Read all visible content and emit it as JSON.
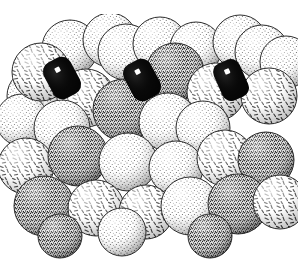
{
  "figure": {
    "kind": "scientific-illustration",
    "style": "black-and-white stippled / hatched line drawing",
    "background_color": "#ffffff",
    "ink_color": "#1a1a1a"
  },
  "caption_fragment": {
    "text": "clipped text line at top edge",
    "visible": "partial descenders only"
  },
  "palette": {
    "outline": "#222222",
    "fill_light": "#ffffff",
    "fill_mid": "#d8d8d8",
    "fill_dark": "#7a7a7a",
    "linker_black": "#0b0b0b",
    "highlight_white": "#ffffff"
  },
  "legend": {
    "sphere_textures": [
      {
        "id": "dash",
        "label": "short-dash hatch (lightest spheres)"
      },
      {
        "id": "fine-stipple",
        "label": "fine stipple (mid-tone spheres)"
      },
      {
        "id": "dense-stipple",
        "label": "dense stipple (dark spheres)"
      }
    ]
  },
  "linkers": [
    {
      "id": "linker-left",
      "cx": 62,
      "cy": 78,
      "w": 30,
      "h": 40,
      "rot": -28,
      "highlight": true
    },
    {
      "id": "linker-center",
      "cx": 142,
      "cy": 80,
      "w": 30,
      "h": 40,
      "rot": -28,
      "highlight": true
    },
    {
      "id": "linker-right",
      "cx": 231,
      "cy": 80,
      "w": 28,
      "h": 40,
      "rot": -24,
      "highlight": true
    }
  ],
  "spheres_back": [
    {
      "cx": 70,
      "cy": 48,
      "r": 28,
      "tex": "fine-stipple"
    },
    {
      "cx": 110,
      "cy": 40,
      "r": 27,
      "tex": "fine-stipple"
    },
    {
      "cx": 126,
      "cy": 52,
      "r": 28,
      "tex": "fine-stipple"
    },
    {
      "cx": 160,
      "cy": 44,
      "r": 27,
      "tex": "fine-stipple"
    },
    {
      "cx": 196,
      "cy": 48,
      "r": 26,
      "tex": "fine-stipple"
    },
    {
      "cx": 240,
      "cy": 42,
      "r": 27,
      "tex": "fine-stipple"
    },
    {
      "cx": 262,
      "cy": 52,
      "r": 27,
      "tex": "fine-stipple"
    },
    {
      "cx": 286,
      "cy": 62,
      "r": 26,
      "tex": "fine-stipple"
    },
    {
      "cx": 34,
      "cy": 96,
      "r": 27,
      "tex": "fine-stipple"
    },
    {
      "cx": 22,
      "cy": 120,
      "r": 26,
      "tex": "fine-stipple"
    }
  ],
  "spheres_mid": [
    {
      "cx": 41,
      "cy": 72,
      "r": 29,
      "tex": "dash"
    },
    {
      "cx": 86,
      "cy": 98,
      "r": 29,
      "tex": "dash"
    },
    {
      "cx": 175,
      "cy": 72,
      "r": 29,
      "tex": "dense-stipple"
    },
    {
      "cx": 124,
      "cy": 110,
      "r": 31,
      "tex": "dense-stipple"
    },
    {
      "cx": 216,
      "cy": 92,
      "r": 29,
      "tex": "dash"
    },
    {
      "cx": 269,
      "cy": 96,
      "r": 28,
      "tex": "dash"
    },
    {
      "cx": 62,
      "cy": 128,
      "r": 28,
      "tex": "fine-stipple"
    },
    {
      "cx": 168,
      "cy": 122,
      "r": 29,
      "tex": "fine-stipple"
    },
    {
      "cx": 203,
      "cy": 128,
      "r": 27,
      "tex": "fine-stipple"
    }
  ],
  "spheres_front": [
    {
      "cx": 26,
      "cy": 166,
      "r": 28,
      "tex": "dash"
    },
    {
      "cx": 78,
      "cy": 156,
      "r": 30,
      "tex": "dense-stipple"
    },
    {
      "cx": 128,
      "cy": 162,
      "r": 29,
      "tex": "fine-stipple"
    },
    {
      "cx": 176,
      "cy": 168,
      "r": 27,
      "tex": "fine-stipple"
    },
    {
      "cx": 225,
      "cy": 158,
      "r": 28,
      "tex": "dash"
    },
    {
      "cx": 266,
      "cy": 160,
      "r": 28,
      "tex": "dense-stipple"
    },
    {
      "cx": 44,
      "cy": 206,
      "r": 30,
      "tex": "dense-stipple"
    },
    {
      "cx": 96,
      "cy": 208,
      "r": 28,
      "tex": "dash"
    },
    {
      "cx": 146,
      "cy": 212,
      "r": 27,
      "tex": "dash"
    },
    {
      "cx": 190,
      "cy": 206,
      "r": 29,
      "tex": "fine-stipple"
    },
    {
      "cx": 238,
      "cy": 204,
      "r": 30,
      "tex": "dense-stipple"
    },
    {
      "cx": 280,
      "cy": 202,
      "r": 27,
      "tex": "dash"
    },
    {
      "cx": 122,
      "cy": 232,
      "r": 24,
      "tex": "fine-stipple"
    },
    {
      "cx": 60,
      "cy": 236,
      "r": 22,
      "tex": "dense-stipple"
    },
    {
      "cx": 210,
      "cy": 236,
      "r": 22,
      "tex": "dense-stipple"
    }
  ]
}
